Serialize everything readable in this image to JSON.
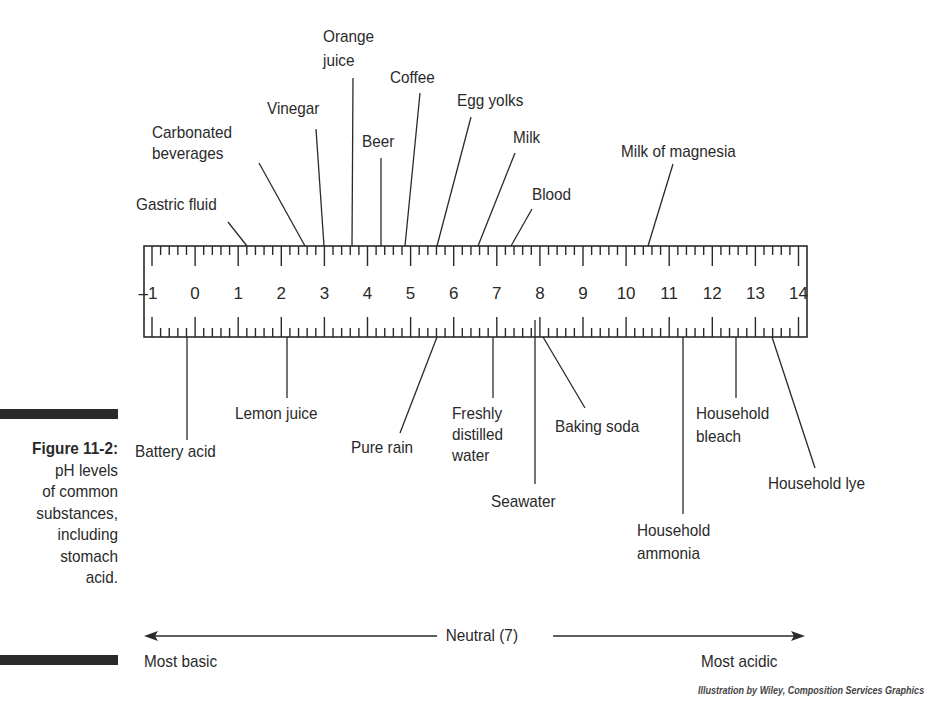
{
  "figure": {
    "number": "Figure 11-2:",
    "caption_lines": [
      "pH levels",
      "of common",
      "substances,",
      "including",
      "stomach",
      "acid."
    ],
    "credit": "Illustration by Wiley, Composition Services Graphics"
  },
  "scale": {
    "neutral_label": "Neutral (7)",
    "left_label": "Most basic",
    "right_label": "Most acidic"
  },
  "chart_data": {
    "type": "scale-diagram",
    "title": "pH levels of common substances, including stomach acid",
    "axis": {
      "min": -1,
      "max": 14,
      "ticks": [
        -1,
        0,
        1,
        2,
        3,
        4,
        5,
        6,
        7,
        8,
        9,
        10,
        11,
        12,
        13,
        14
      ]
    },
    "annotations": {
      "neutral": "Neutral (7)",
      "left_end": "Most basic",
      "right_end": "Most acidic"
    },
    "top_labels": [
      {
        "name": "Gastric fluid",
        "ph": 1.2
      },
      {
        "name": "Carbonated beverages",
        "ph": 2.5
      },
      {
        "name": "Vinegar",
        "ph": 2.9
      },
      {
        "name": "Orange juice",
        "ph": 3.7
      },
      {
        "name": "Beer",
        "ph": 4.4
      },
      {
        "name": "Coffee",
        "ph": 5.0
      },
      {
        "name": "Egg yolks",
        "ph": 5.8
      },
      {
        "name": "Milk",
        "ph": 6.7
      },
      {
        "name": "Blood",
        "ph": 7.5
      },
      {
        "name": "Milk of magnesia",
        "ph": 10.8
      }
    ],
    "bottom_labels": [
      {
        "name": "Battery acid",
        "ph": -0.3
      },
      {
        "name": "Lemon juice",
        "ph": 2.0
      },
      {
        "name": "Pure rain",
        "ph": 5.7
      },
      {
        "name": "Freshly distilled water",
        "ph": 7.0
      },
      {
        "name": "Seawater",
        "ph": 8.0
      },
      {
        "name": "Baking soda",
        "ph": 8.2
      },
      {
        "name": "Household ammonia",
        "ph": 11.5
      },
      {
        "name": "Household bleach",
        "ph": 12.7
      },
      {
        "name": "Household lye",
        "ph": 13.5
      }
    ]
  },
  "labels": {
    "gastric": "Gastric fluid",
    "carb1": "Carbonated",
    "carb2": "beverages",
    "vinegar": "Vinegar",
    "oj1": "Orange",
    "oj2": "juice",
    "beer": "Beer",
    "coffee": "Coffee",
    "egg": "Egg yolks",
    "milk": "Milk",
    "blood": "Blood",
    "mom": "Milk of magnesia",
    "battery": "Battery acid",
    "lemon": "Lemon juice",
    "rain": "Pure rain",
    "fdw1": "Freshly",
    "fdw2": "distilled",
    "fdw3": "water",
    "sea": "Seawater",
    "soda": "Baking soda",
    "amm1": "Household",
    "amm2": "ammonia",
    "bl1": "Household",
    "bl2": "bleach",
    "lye": "Household lye"
  }
}
